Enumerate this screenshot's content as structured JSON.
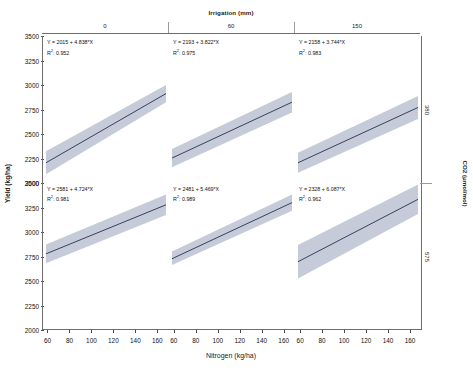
{
  "figure": {
    "y_axis_title": "Yield (kg/ha)",
    "x_axis_title": "Nitrogen (kg/ha)",
    "top_axis_title": "Irrigation (mm)",
    "right_axis_title": "CO2 (μmol/mol)"
  },
  "axes": {
    "y_ticks": [
      "3500",
      "3250",
      "3000",
      "2750",
      "2500",
      "2250",
      "2000"
    ],
    "x_ticks": [
      "60",
      "80",
      "100",
      "120",
      "140",
      "160"
    ],
    "ylim": [
      2000,
      3500
    ],
    "xlim": [
      55,
      170
    ]
  },
  "strips": {
    "columns": [
      "0",
      "60",
      "150"
    ],
    "rows": [
      "380",
      "575"
    ]
  },
  "colors": {
    "band": "#c5cbd8",
    "line": "#2a3050",
    "axis": "#6e6e6e"
  },
  "panels": [
    {
      "row_label": "380",
      "col_label": "0",
      "equation": "Y = 2015 + 4.838*X",
      "r2_label": "R",
      "r2_value": ": 0.952"
    },
    {
      "row_label": "380",
      "col_label": "60",
      "equation": "Y = 2193 + 3.822*X",
      "r2_label": "R",
      "r2_value": ": 0.975"
    },
    {
      "row_label": "380",
      "col_label": "150",
      "equation": "Y = 2158 + 3.744*X",
      "r2_label": "R",
      "r2_value": ": 0.983"
    },
    {
      "row_label": "575",
      "col_label": "0",
      "equation": "Y = 2581 + 4.724*X",
      "r2_label": "R",
      "r2_value": ": 0.981"
    },
    {
      "row_label": "575",
      "col_label": "60",
      "equation": "Y = 2481 + 5.469*X",
      "r2_label": "R",
      "r2_value": ": 0.989"
    },
    {
      "row_label": "575",
      "col_label": "150",
      "equation": "Y = 2328 + 6.087*X",
      "r2_label": "R",
      "r2_value": ": 0.962"
    }
  ],
  "chart_data": {
    "type": "line",
    "title": "",
    "xlabel": "Nitrogen (kg/ha)",
    "ylabel": "Yield (kg/ha)",
    "xlim": [
      55,
      170
    ],
    "ylim": [
      2000,
      3500
    ],
    "grid": false,
    "legend": "none",
    "facet_col_variable": "Irrigation (mm)",
    "facet_col_levels": [
      "0",
      "60",
      "150"
    ],
    "facet_row_variable": "CO2 (μmol/mol)",
    "facet_row_levels": [
      "380",
      "575"
    ],
    "x_ticks": [
      60,
      80,
      100,
      120,
      140,
      160
    ],
    "y_ticks": [
      2000,
      2250,
      2500,
      2750,
      3000,
      3250,
      3500
    ],
    "series": [
      {
        "name": "CO2 380 / Irrigation 0",
        "intercept": 2015,
        "slope": 4.838,
        "r2": 0.952,
        "x": [
          60,
          165
        ],
        "fit": [
          2305,
          2813
        ],
        "ci_lower": [
          2110,
          2600
        ],
        "ci_upper": [
          2500,
          3025
        ]
      },
      {
        "name": "CO2 380 / Irrigation 60",
        "intercept": 2193,
        "slope": 3.822,
        "r2": 0.975,
        "x": [
          60,
          165
        ],
        "fit": [
          2422,
          2824
        ],
        "ci_lower": [
          2330,
          2720
        ],
        "ci_upper": [
          2515,
          2930
        ]
      },
      {
        "name": "CO2 380 / Irrigation 150",
        "intercept": 2158,
        "slope": 3.744,
        "r2": 0.983,
        "x": [
          60,
          165
        ],
        "fit": [
          2383,
          2776
        ],
        "ci_lower": [
          2280,
          2660
        ],
        "ci_upper": [
          2485,
          2895
        ]
      },
      {
        "name": "CO2 575 / Irrigation 0",
        "intercept": 2581,
        "slope": 4.724,
        "r2": 0.981,
        "x": [
          60,
          165
        ],
        "fit": [
          2864,
          3360
        ],
        "ci_lower": [
          2775,
          3255
        ],
        "ci_upper": [
          2955,
          3465
        ]
      },
      {
        "name": "CO2 575 / Irrigation 60",
        "intercept": 2481,
        "slope": 5.469,
        "r2": 0.989,
        "x": [
          60,
          165
        ],
        "fit": [
          2809,
          3383
        ],
        "ci_lower": [
          2740,
          3300
        ],
        "ci_upper": [
          2880,
          3465
        ]
      },
      {
        "name": "CO2 575 / Irrigation 150",
        "intercept": 2328,
        "slope": 6.087,
        "r2": 0.962,
        "x": [
          60,
          165
        ],
        "fit": [
          2693,
          3332
        ],
        "ci_lower": [
          2520,
          3130
        ],
        "ci_upper": [
          2865,
          3535
        ]
      }
    ]
  }
}
